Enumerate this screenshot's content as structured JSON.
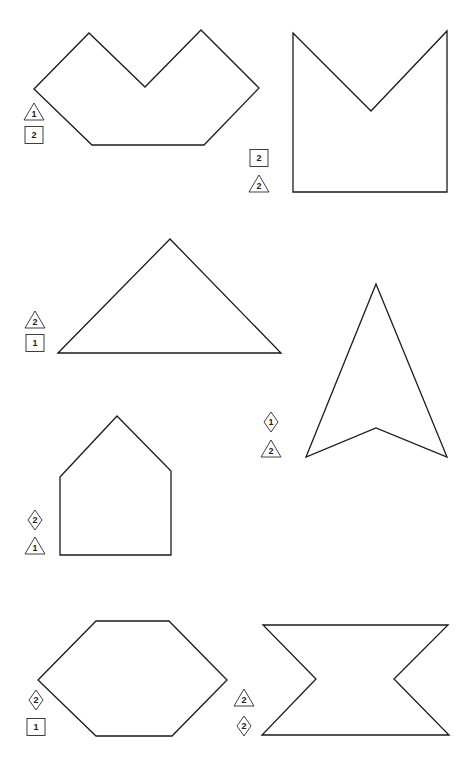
{
  "page": {
    "width": 474,
    "height": 765,
    "background": "#ffffff",
    "stroke_color": "#1a1a1a"
  },
  "figures": [
    {
      "id": "fig-v-hexagon",
      "name": "v-notched-hexagon",
      "points": [
        [
          34,
          89
        ],
        [
          89,
          33
        ],
        [
          145,
          87
        ],
        [
          201,
          30
        ],
        [
          259,
          88
        ],
        [
          204,
          145
        ],
        [
          92,
          145
        ]
      ],
      "markers": [
        {
          "type": "triangle",
          "label": "1",
          "x": 34,
          "y": 112
        },
        {
          "type": "square",
          "label": "2",
          "x": 34,
          "y": 135
        }
      ]
    },
    {
      "id": "fig-m-pentagon",
      "name": "m-notched-square",
      "points": [
        [
          293,
          33
        ],
        [
          371,
          111
        ],
        [
          447,
          31
        ],
        [
          447,
          192
        ],
        [
          293,
          192
        ]
      ],
      "markers": [
        {
          "type": "square",
          "label": "2",
          "x": 259,
          "y": 158
        },
        {
          "type": "triangle",
          "label": "2",
          "x": 259,
          "y": 184
        }
      ]
    },
    {
      "id": "fig-triangle",
      "name": "isosceles-triangle",
      "points": [
        [
          58,
          353
        ],
        [
          170,
          239
        ],
        [
          281,
          353
        ]
      ],
      "markers": [
        {
          "type": "triangle",
          "label": "2",
          "x": 35,
          "y": 320
        },
        {
          "type": "square",
          "label": "1",
          "x": 35,
          "y": 343
        }
      ]
    },
    {
      "id": "fig-arrowhead",
      "name": "arrowhead",
      "points": [
        [
          376,
          284
        ],
        [
          447,
          457
        ],
        [
          376,
          428
        ],
        [
          306,
          457
        ]
      ],
      "markers": [
        {
          "type": "diamond",
          "label": "1",
          "x": 271,
          "y": 422
        },
        {
          "type": "triangle",
          "label": "2",
          "x": 271,
          "y": 449
        }
      ]
    },
    {
      "id": "fig-house",
      "name": "house-pentagon",
      "points": [
        [
          60,
          477
        ],
        [
          117,
          416
        ],
        [
          171,
          471
        ],
        [
          171,
          555
        ],
        [
          60,
          555
        ]
      ],
      "markers": [
        {
          "type": "diamond",
          "label": "2",
          "x": 35,
          "y": 520
        },
        {
          "type": "triangle",
          "label": "1",
          "x": 35,
          "y": 546
        }
      ]
    },
    {
      "id": "fig-hexagon",
      "name": "hexagon",
      "points": [
        [
          38,
          680
        ],
        [
          96,
          621
        ],
        [
          169,
          621
        ],
        [
          227,
          680
        ],
        [
          172,
          736
        ],
        [
          96,
          736
        ]
      ],
      "markers": [
        {
          "type": "diamond",
          "label": "2",
          "x": 36,
          "y": 700
        },
        {
          "type": "square",
          "label": "1",
          "x": 36,
          "y": 727
        }
      ]
    },
    {
      "id": "fig-bowtie",
      "name": "notched-bowtie",
      "points": [
        [
          263,
          625
        ],
        [
          448,
          625
        ],
        [
          394,
          679
        ],
        [
          449,
          735
        ],
        [
          262,
          735
        ],
        [
          316,
          679
        ]
      ],
      "markers": [
        {
          "type": "triangle",
          "label": "2",
          "x": 244,
          "y": 698
        },
        {
          "type": "diamond",
          "label": "2",
          "x": 244,
          "y": 726
        }
      ]
    }
  ]
}
